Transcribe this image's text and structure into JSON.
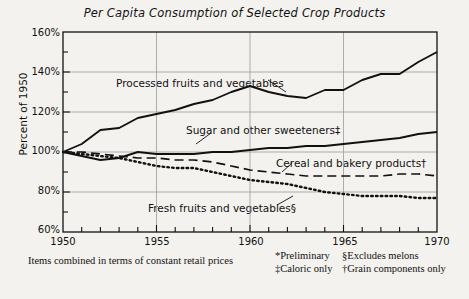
{
  "chart_data": {
    "type": "line",
    "title": "Per Capita Consumption of  Selected Crop Products",
    "xlabel": "",
    "ylabel": "Percent of 1950",
    "xlim": [
      1950,
      1970
    ],
    "ylim": [
      60,
      160
    ],
    "ytick_labels": [
      "160%",
      "140%",
      "120%",
      "100%",
      "80%",
      "60%"
    ],
    "ytick_values": [
      160,
      140,
      120,
      100,
      80,
      60
    ],
    "yminor_values": [
      150,
      130,
      110,
      90,
      70
    ],
    "xtick_labels": [
      "1950",
      "1955",
      "1960",
      "1965",
      "1970"
    ],
    "xtick_values": [
      1950,
      1955,
      1960,
      1965,
      1970
    ],
    "xminor_values": [
      1951,
      1952,
      1953,
      1954,
      1956,
      1957,
      1958,
      1959,
      1961,
      1962,
      1963,
      1964,
      1966,
      1967,
      1968,
      1969
    ],
    "grid": "major gridlines on both axes",
    "legend": "inline labels with leader lines",
    "x": [
      1950,
      1951,
      1952,
      1953,
      1954,
      1955,
      1956,
      1957,
      1958,
      1959,
      1960,
      1961,
      1962,
      1963,
      1964,
      1965,
      1966,
      1967,
      1968,
      1969,
      1970
    ],
    "series": [
      {
        "name": "Processed fruits and vegetables",
        "style": "solid",
        "values": [
          100,
          104,
          111,
          112,
          117,
          119,
          121,
          124,
          126,
          130,
          133,
          130,
          128,
          127,
          131,
          131,
          136,
          139,
          139,
          145,
          150
        ]
      },
      {
        "name": "Sugar and other sweeteners‡",
        "style": "solid",
        "values": [
          100,
          98,
          96,
          97,
          100,
          99,
          99,
          99,
          100,
          100,
          101,
          102,
          102,
          103,
          103,
          104,
          105,
          106,
          107,
          109,
          110
        ]
      },
      {
        "name": "Cereal and bakery products†",
        "style": "dashed",
        "values": [
          100,
          100,
          99,
          98,
          97,
          97,
          96,
          96,
          95,
          93,
          91,
          90,
          89,
          88,
          88,
          88,
          88,
          88,
          89,
          89,
          88
        ]
      },
      {
        "name": "Fresh fruits and vegetables§",
        "style": "dotted",
        "values": [
          100,
          99,
          98,
          97,
          95,
          93,
          92,
          92,
          90,
          88,
          86,
          85,
          84,
          82,
          80,
          79,
          78,
          78,
          78,
          77,
          77
        ]
      }
    ]
  },
  "labels": {
    "processed": "Processed fruits and vegetables",
    "sugar": "Sugar and other sweeteners‡",
    "cereal": "Cereal and bakery products†",
    "fresh": "Fresh fruits and vegetables§"
  },
  "footnotes": {
    "main": "Items combined in terms of constant retail prices",
    "preliminary": "*Preliminary",
    "caloric": "‡Caloric only",
    "melons": "§Excludes melons",
    "grain": "†Grain components only"
  },
  "colors": {
    "background": "#f4f2ee",
    "line": "#111111",
    "grid": "#9a9a9a",
    "axis": "#111111"
  }
}
